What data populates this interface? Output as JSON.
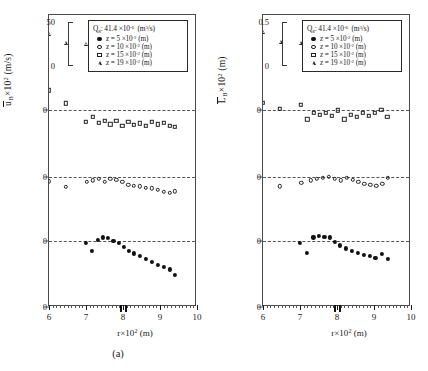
{
  "figure": {
    "panels": [
      {
        "id": "a",
        "caption": "(a)",
        "ylabel_main": "u",
        "ylabel_sub": "B",
        "ylabel_rest": "×10",
        "ylabel_exp": "2",
        "ylabel_unit": "(m/s)",
        "scale_top": "50",
        "scale_bottom": "0",
        "zero_labels": [
          "0",
          "0",
          "0"
        ]
      },
      {
        "id": "b",
        "caption": "(b)",
        "ylabel_main": "L",
        "ylabel_sub": "B",
        "ylabel_rest": "×10",
        "ylabel_exp": "2",
        "ylabel_unit": "(m)",
        "scale_top": "0.5",
        "scale_bottom": "0",
        "zero_labels": [
          "0",
          "0",
          "0"
        ]
      }
    ],
    "legend": {
      "title_sym": "Q",
      "title_sub": "g",
      "title_sep": ": 41.4",
      "title_mult": "×10",
      "title_exp": "-6",
      "title_unit_open": "(m",
      "title_unit_exp": "3",
      "title_unit_close": "/s)",
      "entries": [
        {
          "symbol": "filled-circle",
          "z_eq": "z = 5",
          "mult": "×10",
          "exp": "-2",
          "unit": "(m)"
        },
        {
          "symbol": "open-circle",
          "z_eq": "z = 10",
          "mult": "×10",
          "exp": "-2",
          "unit": "(m)"
        },
        {
          "symbol": "open-square",
          "z_eq": "z = 15",
          "mult": "×10",
          "exp": "-2",
          "unit": "(m)"
        },
        {
          "symbol": "open-triangle",
          "z_eq": "z = 19",
          "mult": "×10",
          "exp": "-2",
          "unit": "(m)"
        }
      ]
    },
    "xaxis": {
      "label_sym": "r",
      "label_mult": "×10",
      "label_exp": "2",
      "label_unit": "(m)",
      "tick_labels": [
        "6",
        "7",
        "8",
        "9",
        "10"
      ],
      "min": 6,
      "max": 10,
      "highlight_x": [
        7.92,
        8.06
      ]
    }
  },
  "chart_data": {
    "type": "scatter",
    "title": "",
    "xlabel": "r×10^2 (m)",
    "xlim": [
      6,
      10
    ],
    "tick_labels": [
      "6",
      "7",
      "8",
      "9",
      "10"
    ],
    "grid": false,
    "legend_position": "top-right",
    "legend_title": "Qg : 41.4 ×10^-6 (m^3/s)",
    "panels": [
      {
        "id": "a",
        "ylabel": "ūB×10^2 (m/s)",
        "scale_range": [
          0,
          50
        ],
        "scale_units": "10^-2 m/s",
        "note": "Four z-levels drawn as vertically offset sub-panels, each with its own zero baseline.",
        "series": [
          {
            "name": "z = 19 ×10^-2 (m)",
            "symbol": "open-triangle",
            "baseline_index": 0,
            "x": [
              6.0,
              6.45,
              7.0,
              7.2,
              7.35,
              7.5,
              7.66,
              7.8,
              7.95,
              8.1,
              8.25,
              8.42,
              8.58,
              8.72,
              8.86,
              9.0,
              9.14,
              9.28,
              9.4
            ],
            "y": [
              21.0,
              18.5,
              18.2,
              19.6,
              17.2,
              18.6,
              17.4,
              18.4,
              17.0,
              17.6,
              17.4,
              17.6,
              17.8,
              17.4,
              18.2,
              18.4,
              17.6,
              17.8,
              17.6
            ]
          },
          {
            "name": "z = 15 ×10^-2 (m)",
            "symbol": "open-square",
            "baseline_index": 1,
            "x": [
              6.0,
              6.45,
              7.0,
              7.18,
              7.34,
              7.5,
              7.66,
              7.82,
              7.98,
              8.14,
              8.3,
              8.46,
              8.62,
              8.78,
              8.94,
              9.1,
              9.26,
              9.4
            ],
            "y": [
              24.0,
              20.4,
              15.2,
              16.6,
              15.0,
              15.6,
              14.6,
              15.6,
              14.2,
              15.2,
              14.4,
              14.8,
              14.2,
              15.2,
              14.6,
              15.0,
              14.2,
              13.8
            ]
          },
          {
            "name": "z = 10 ×10^-2 (m)",
            "symbol": "open-circle",
            "baseline_index": 2,
            "x": [
              6.0,
              6.45,
              7.02,
              7.18,
              7.34,
              7.5,
              7.66,
              7.82,
              7.98,
              8.14,
              8.3,
              8.46,
              8.62,
              8.78,
              8.94,
              9.1,
              9.26,
              9.4
            ],
            "y": [
              16.6,
              15.0,
              16.4,
              16.8,
              17.2,
              16.4,
              17.2,
              17.0,
              16.4,
              15.6,
              15.4,
              15.2,
              14.8,
              14.6,
              14.2,
              13.6,
              13.4,
              13.8
            ]
          },
          {
            "name": "z = 5 ×10^-2 (m)",
            "symbol": "filled-circle",
            "baseline_index": 3,
            "x": [
              7.0,
              7.16,
              7.32,
              7.46,
              7.6,
              7.74,
              7.88,
              8.02,
              8.16,
              8.3,
              8.46,
              8.62,
              8.78,
              8.94,
              9.1,
              9.26,
              9.4
            ],
            "y": [
              17.6,
              15.6,
              18.6,
              19.2,
              19.0,
              18.2,
              17.6,
              16.6,
              15.6,
              14.8,
              14.0,
              13.2,
              12.4,
              11.6,
              11.0,
              10.4,
              8.8
            ]
          }
        ]
      },
      {
        "id": "b",
        "ylabel": "L̄B×10^2 (m)",
        "scale_range": [
          0,
          0.5
        ],
        "scale_units": "10^-2 m",
        "note": "Four z-levels drawn as vertically offset sub-panels, each with its own zero baseline.",
        "series": [
          {
            "name": "z = 19 ×10^-2 (m)",
            "symbol": "open-triangle",
            "baseline_index": 0,
            "x": [
              6.0,
              6.48,
              7.02,
              7.22,
              7.38,
              7.54,
              7.7,
              7.86,
              8.02,
              8.18,
              8.34,
              8.5,
              8.66,
              8.82,
              8.98,
              9.14,
              9.3,
              9.42
            ],
            "y": [
              0.215,
              0.188,
              0.186,
              0.205,
              0.168,
              0.196,
              0.186,
              0.182,
              0.176,
              0.186,
              0.18,
              0.186,
              0.184,
              0.188,
              0.186,
              0.188,
              0.184,
              0.182
            ]
          },
          {
            "name": "z = 15 ×10^-2 (m)",
            "symbol": "open-square",
            "baseline_index": 1,
            "x": [
              6.0,
              6.46,
              7.02,
              7.2,
              7.38,
              7.54,
              7.7,
              7.86,
              8.02,
              8.2,
              8.38,
              8.54,
              8.7,
              8.86,
              9.02,
              9.2,
              9.36
            ],
            "y": [
              0.205,
              0.188,
              0.2,
              0.16,
              0.178,
              0.172,
              0.178,
              0.17,
              0.184,
              0.16,
              0.172,
              0.166,
              0.178,
              0.17,
              0.178,
              0.186,
              0.166
            ]
          },
          {
            "name": "z = 10 ×10^-2 (m)",
            "symbol": "open-circle",
            "baseline_index": 2,
            "x": [
              6.46,
              7.04,
              7.3,
              7.46,
              7.62,
              7.78,
              7.94,
              8.1,
              8.26,
              8.42,
              8.58,
              8.74,
              8.9,
              9.06,
              9.22,
              9.38
            ],
            "y": [
              0.152,
              0.162,
              0.168,
              0.172,
              0.176,
              0.178,
              0.172,
              0.168,
              0.176,
              0.17,
              0.164,
              0.158,
              0.156,
              0.154,
              0.158,
              0.176
            ]
          },
          {
            "name": "z = 5 ×10^-2 (m)",
            "symbol": "filled-circle",
            "baseline_index": 3,
            "x": [
              7.0,
              7.18,
              7.36,
              7.52,
              7.66,
              7.8,
              7.94,
              8.08,
              8.24,
              8.4,
              8.56,
              8.72,
              8.88,
              9.04,
              9.22,
              9.38
            ],
            "y": [
              0.176,
              0.15,
              0.192,
              0.196,
              0.194,
              0.192,
              0.18,
              0.17,
              0.162,
              0.156,
              0.15,
              0.144,
              0.14,
              0.136,
              0.146,
              0.132
            ]
          }
        ]
      }
    ]
  }
}
